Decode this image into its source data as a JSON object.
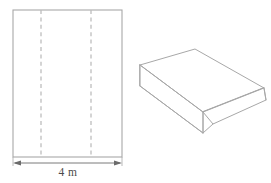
{
  "figure": {
    "stroke_color": "#a8a8a8",
    "dash_color": "#bdbdbd",
    "dimension_color": "#6b6b6b",
    "background": "#ffffff",
    "flat_sheet": {
      "name": "flat-rectangular-sheet",
      "outline": {
        "x": 13,
        "y": 10,
        "width": 109,
        "height": 147
      },
      "fold_lines": [
        {
          "label": "left-fold-line",
          "x": 41
        },
        {
          "label": "right-fold-line",
          "x": 91
        }
      ],
      "dimension": {
        "label": "4 m",
        "value": 4,
        "unit": "m",
        "axis": "width",
        "arrow_y": 163,
        "x_start": 13,
        "x_end": 122,
        "label_x": 68,
        "label_y": 176
      }
    },
    "folded_shape": {
      "name": "folded-channel-solid",
      "description": "open channel formed by folding the sheet along the two dashed lines",
      "top_face": "140,65 195,49 264,88 203,112",
      "left_flange": "140,65 203,112 203,133 140,86",
      "right_flange": "264,88 266,100 213,124 203,112",
      "left_edge_line": "140,65 140,86",
      "front_inner_line": "203,112 203,133",
      "right_inner_line": "264,88 266,100",
      "bottom_edge_line": "140,86 203,133",
      "right_lower_line": "203,133 213,124"
    }
  }
}
